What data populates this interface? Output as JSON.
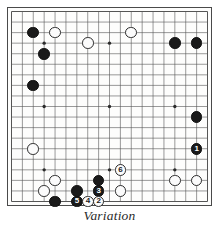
{
  "figure": {
    "caption": "Variation",
    "board": {
      "size": 19,
      "star_points": [
        [
          3,
          3
        ],
        [
          9,
          3
        ],
        [
          15,
          3
        ],
        [
          3,
          9
        ],
        [
          9,
          9
        ],
        [
          15,
          9
        ],
        [
          3,
          15
        ],
        [
          9,
          15
        ],
        [
          15,
          15
        ]
      ],
      "line_color": "#555555",
      "edge_color": "#333333",
      "background_color": "#fdfdfc"
    },
    "stones": [
      {
        "name": "black-stone-c16",
        "color": "black",
        "col": 2,
        "row": 2,
        "label": ""
      },
      {
        "name": "white-stone-e16",
        "color": "white",
        "col": 4,
        "row": 2,
        "label": ""
      },
      {
        "name": "white-stone-h17",
        "color": "white",
        "col": 11,
        "row": 2,
        "label": ""
      },
      {
        "name": "white-stone-g16",
        "color": "white",
        "col": 7,
        "row": 3,
        "label": ""
      },
      {
        "name": "black-stone-q16",
        "color": "black",
        "col": 15,
        "row": 3,
        "label": ""
      },
      {
        "name": "black-stone-s16",
        "color": "black",
        "col": 17,
        "row": 3,
        "label": ""
      },
      {
        "name": "black-stone-c14",
        "color": "black",
        "col": 3,
        "row": 4,
        "label": ""
      },
      {
        "name": "black-stone-c12",
        "color": "black",
        "col": 2,
        "row": 7,
        "label": ""
      },
      {
        "name": "black-stone-r9",
        "color": "black",
        "col": 17,
        "row": 10,
        "label": ""
      },
      {
        "name": "white-stone-c7",
        "color": "white",
        "col": 2,
        "row": 13,
        "label": ""
      },
      {
        "name": "black-stone-r7-move1",
        "color": "black",
        "col": 17,
        "row": 13,
        "label": "1"
      },
      {
        "name": "white-stone-h5-move6",
        "color": "white",
        "col": 10,
        "row": 15,
        "label": "6"
      },
      {
        "name": "white-stone-d4",
        "color": "white",
        "col": 4,
        "row": 16,
        "label": ""
      },
      {
        "name": "black-stone-h4",
        "color": "black",
        "col": 8,
        "row": 16,
        "label": ""
      },
      {
        "name": "white-stone-p4",
        "color": "white",
        "col": 15,
        "row": 16,
        "label": ""
      },
      {
        "name": "white-stone-r4",
        "color": "white",
        "col": 17,
        "row": 16,
        "label": ""
      },
      {
        "name": "white-stone-c3",
        "color": "white",
        "col": 3,
        "row": 17,
        "label": ""
      },
      {
        "name": "black-stone-f3",
        "color": "black",
        "col": 6,
        "row": 17,
        "label": ""
      },
      {
        "name": "black-stone-h3-move3",
        "color": "black",
        "col": 8,
        "row": 17,
        "label": "3"
      },
      {
        "name": "white-stone-j3",
        "color": "white",
        "col": 10,
        "row": 17,
        "label": ""
      },
      {
        "name": "black-stone-d2",
        "color": "black",
        "col": 4,
        "row": 18,
        "label": ""
      },
      {
        "name": "black-stone-f2-move5",
        "color": "black",
        "col": 6,
        "row": 18,
        "label": "5"
      },
      {
        "name": "white-stone-g2-move4",
        "color": "white",
        "col": 7,
        "row": 18,
        "label": "4"
      },
      {
        "name": "white-stone-h2-move2",
        "color": "white",
        "col": 8,
        "row": 18,
        "label": "2"
      }
    ]
  }
}
